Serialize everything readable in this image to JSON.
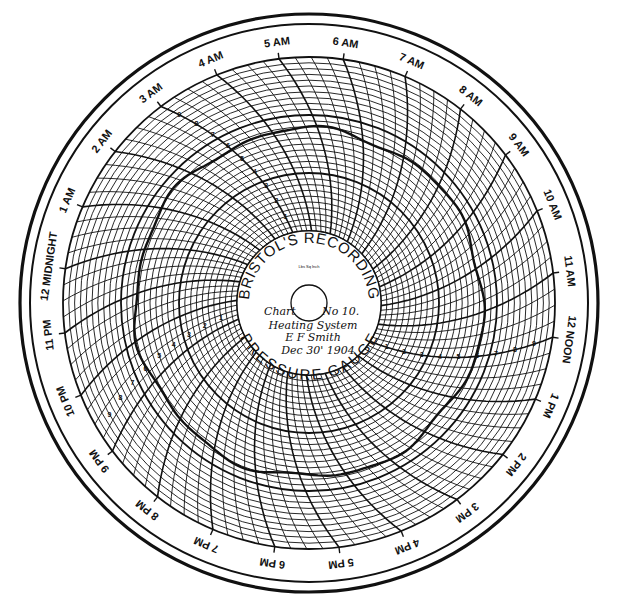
{
  "chart": {
    "brand_top": "BRISTOL'S RECORDING",
    "brand_bottom": "PRESSURE GAUGE",
    "maker_small": "Lbs Sq Inch",
    "handwritten": {
      "line1_left": "Chart",
      "line1_right": "No 10.",
      "line2": "Heating System",
      "line3": "E F Smith",
      "line4": "Dec 30' 1904"
    },
    "hour_labels": [
      "12 NOON",
      "1 PM",
      "2 PM",
      "3 PM",
      "4 PM",
      "5 PM",
      "6 PM",
      "7 PM",
      "8 PM",
      "9 PM",
      "10 PM",
      "11 PM",
      "12 MIDNIGHT",
      "1 AM",
      "2 AM",
      "3 AM",
      "4 AM",
      "5 AM",
      "6 AM",
      "7 AM",
      "8 AM",
      "9 AM",
      "10 AM",
      "11 AM"
    ],
    "pressure_scale_numbers": [
      "1",
      "2",
      "3",
      "4",
      "5",
      "6",
      "7",
      "8",
      "9"
    ],
    "colors": {
      "ink": "#111111",
      "paper": "#ffffff"
    }
  },
  "chart_data": {
    "type": "polar",
    "subtitle": "Chart No 10. Heating System, E F Smith, Dec 30' 1904",
    "angular_axis": {
      "unit": "hour",
      "ticks": [
        "12 NOON",
        "1 PM",
        "2 PM",
        "3 PM",
        "4 PM",
        "5 PM",
        "6 PM",
        "7 PM",
        "8 PM",
        "9 PM",
        "10 PM",
        "11 PM",
        "12 MIDNIGHT",
        "1 AM",
        "2 AM",
        "3 AM",
        "4 AM",
        "5 AM",
        "6 AM",
        "7 AM",
        "8 AM",
        "9 AM",
        "10 AM",
        "11 AM"
      ],
      "direction": "clockwise",
      "start_position": "right (3 o'clock)"
    },
    "radial_axis": {
      "label": "Lbs per Sq Inch",
      "ticks": [
        0,
        1,
        2,
        3,
        4,
        5,
        6,
        7,
        8,
        9,
        10
      ],
      "range": [
        0,
        10
      ]
    },
    "series": [
      {
        "name": "recorded pressure trace",
        "description": "roughly constant trace near the heavy concentric ring throughout the day",
        "approx_value": 5
      }
    ]
  }
}
